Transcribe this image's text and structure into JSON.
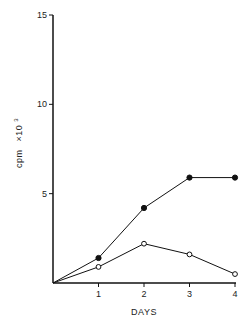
{
  "chart_data": {
    "type": "line",
    "title": "",
    "xlabel": "DAYS",
    "ylabel": "cpm ×10³",
    "ylabel_main": "cpm",
    "ylabel_mult": "×10",
    "ylabel_exp": "3",
    "x": [
      0,
      1,
      2,
      3,
      4
    ],
    "x_ticks": [
      "1",
      "2",
      "3",
      "4"
    ],
    "y_ticks": [
      "5",
      "10",
      "15"
    ],
    "xlim": [
      0,
      4
    ],
    "ylim": [
      0,
      15
    ],
    "grid": false,
    "legend": null,
    "series": [
      {
        "name": "filled circles",
        "marker": "filled-circle",
        "values": [
          0,
          1.4,
          4.2,
          5.9,
          5.9
        ]
      },
      {
        "name": "open circles",
        "marker": "open-circle",
        "values": [
          0,
          0.9,
          2.2,
          1.6,
          0.5
        ]
      }
    ]
  }
}
